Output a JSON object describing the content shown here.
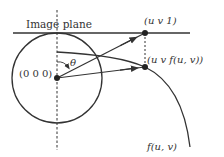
{
  "diagram": {
    "image_plane_label": "Image plane",
    "origin_label": "(0 0 0)",
    "plane_point_label": "(u v 1)",
    "surface_point_label": "(u v f(u, v))",
    "angle_label": "θ",
    "curve_label": "f(u, v)",
    "colors": {
      "stroke": "#333333",
      "background": "#ffffff"
    }
  }
}
